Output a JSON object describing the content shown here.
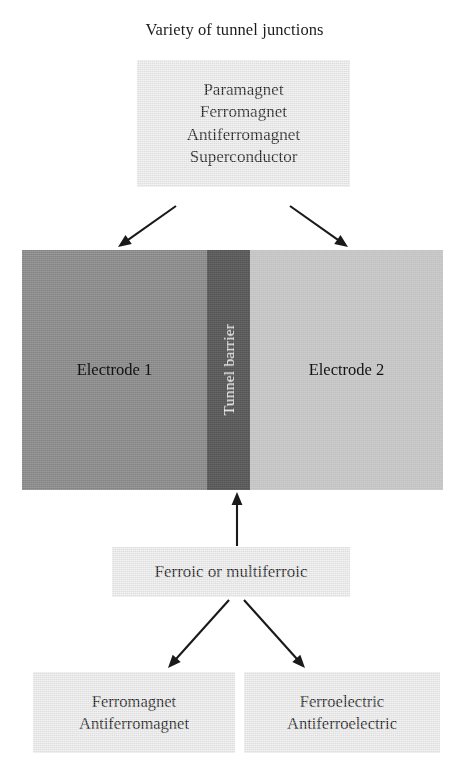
{
  "diagram": {
    "title": "Variety of tunnel junctions",
    "boxes": {
      "top_materials": {
        "lines": [
          "Paramagnet",
          "Ferromagnet",
          "Antiferromagnet",
          "Superconductor"
        ]
      },
      "ferroic": {
        "lines": [
          "Ferroic or multiferroic"
        ]
      },
      "magnetic_orders": {
        "lines": [
          "Ferromagnet",
          "Antiferromagnet"
        ]
      },
      "electric_orders": {
        "lines": [
          "Ferroelectric",
          "Antiferroelectric"
        ]
      }
    },
    "stack": {
      "electrode_1": "Electrode 1",
      "barrier": "Tunnel barrier",
      "electrode_2": "Electrode 2"
    },
    "colors": {
      "background": "#ffffff",
      "box_fill": "#e9e9e9",
      "electrode_1_fill": "#8d8d8d",
      "barrier_fill": "#5c5c5c",
      "electrode_2_fill": "#c6c6c6",
      "text": "#161616",
      "barrier_text": "#f4f4f4",
      "arrow": "#1a1a1a"
    },
    "arrows": [
      {
        "name": "top-box-to-electrode-1",
        "from": [
          176,
          206
        ],
        "to": [
          118,
          247
        ]
      },
      {
        "name": "top-box-to-electrode-2",
        "from": [
          290,
          206
        ],
        "to": [
          348,
          247
        ]
      },
      {
        "name": "ferroic-to-barrier",
        "from": [
          237,
          546
        ],
        "to": [
          237,
          492
        ]
      },
      {
        "name": "ferroic-to-magnetic-orders",
        "from": [
          229,
          600
        ],
        "to": [
          168,
          668
        ]
      },
      {
        "name": "ferroic-to-electric-orders",
        "from": [
          244,
          600
        ],
        "to": [
          305,
          668
        ]
      }
    ]
  }
}
